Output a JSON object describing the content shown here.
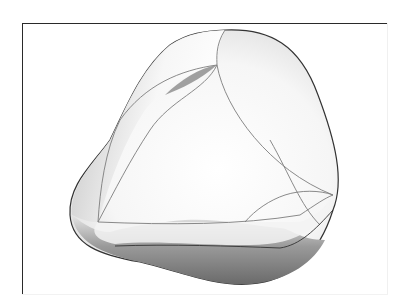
{
  "figure": {
    "colors": {
      "outline": "#333333",
      "edge_curves": "#8a8a8a",
      "dark_shade": "#6e6e6e",
      "mid_shade": "#b5b5b5",
      "highlight": "#ffffff",
      "frame": "#2a2a2a"
    }
  }
}
